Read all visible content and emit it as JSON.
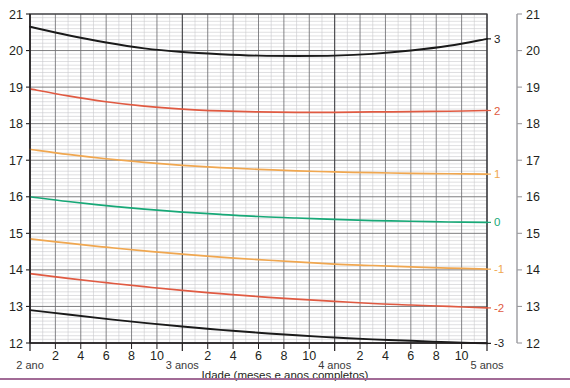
{
  "chart_data": {
    "type": "line",
    "title": "",
    "xlabel": "Idade (meses e anos completos)",
    "ylabel": "",
    "xlim": [
      24,
      60
    ],
    "ylim": [
      12,
      21
    ],
    "grid": true,
    "legend": "right-inline-zscore-labels",
    "y_ticks_left": [
      "21",
      "20",
      "19",
      "18",
      "17",
      "16",
      "15",
      "14",
      "13",
      "12"
    ],
    "y_ticks_right": [
      "21",
      "20",
      "19",
      "18",
      "17",
      "16",
      "15",
      "14",
      "13",
      "12"
    ],
    "x_tick_labels": [
      {
        "value": 24,
        "label": "2 ano",
        "major": true
      },
      {
        "value": 26,
        "label": "2",
        "major": false
      },
      {
        "value": 28,
        "label": "4",
        "major": false
      },
      {
        "value": 30,
        "label": "6",
        "major": false
      },
      {
        "value": 32,
        "label": "8",
        "major": false
      },
      {
        "value": 34,
        "label": "10",
        "major": false
      },
      {
        "value": 36,
        "label": "3 anos",
        "major": true
      },
      {
        "value": 38,
        "label": "2",
        "major": false
      },
      {
        "value": 40,
        "label": "4",
        "major": false
      },
      {
        "value": 42,
        "label": "6",
        "major": false
      },
      {
        "value": 44,
        "label": "8",
        "major": false
      },
      {
        "value": 46,
        "label": "10",
        "major": false
      },
      {
        "value": 48,
        "label": "4 anos",
        "major": true
      },
      {
        "value": 50,
        "label": "2",
        "major": false
      },
      {
        "value": 52,
        "label": "4",
        "major": false
      },
      {
        "value": 54,
        "label": "6",
        "major": false
      },
      {
        "value": 56,
        "label": "8",
        "major": false
      },
      {
        "value": 58,
        "label": "10",
        "major": false
      },
      {
        "value": 60,
        "label": "5 anos",
        "major": true
      }
    ],
    "x": [
      24,
      27,
      30,
      33,
      36,
      39,
      42,
      45,
      48,
      51,
      54,
      57,
      60
    ],
    "series": [
      {
        "name": "3",
        "zscore": "3",
        "color": "#1a1a1a",
        "end_label": "3",
        "values": [
          20.65,
          20.42,
          20.22,
          20.06,
          19.96,
          19.9,
          19.86,
          19.85,
          19.86,
          19.91,
          20.0,
          20.13,
          20.32
        ]
      },
      {
        "name": "2",
        "zscore": "2",
        "color": "#e05a42",
        "end_label": "2",
        "values": [
          18.95,
          18.76,
          18.6,
          18.48,
          18.4,
          18.35,
          18.32,
          18.31,
          18.31,
          18.32,
          18.33,
          18.34,
          18.36
        ]
      },
      {
        "name": "1",
        "zscore": "1",
        "color": "#f0a750",
        "end_label": "1",
        "values": [
          17.3,
          17.16,
          17.04,
          16.94,
          16.86,
          16.8,
          16.75,
          16.71,
          16.68,
          16.66,
          16.64,
          16.63,
          16.62
        ]
      },
      {
        "name": "0",
        "zscore": "0",
        "color": "#17a877",
        "end_label": "0",
        "values": [
          16.0,
          15.87,
          15.76,
          15.66,
          15.58,
          15.52,
          15.46,
          15.42,
          15.38,
          15.35,
          15.33,
          15.31,
          15.3
        ]
      },
      {
        "name": "-1",
        "zscore": "-1",
        "color": "#f0a750",
        "end_label": "-1",
        "values": [
          14.85,
          14.73,
          14.62,
          14.52,
          14.43,
          14.35,
          14.28,
          14.22,
          14.16,
          14.12,
          14.08,
          14.05,
          14.02
        ]
      },
      {
        "name": "-2",
        "zscore": "-2",
        "color": "#e05a42",
        "end_label": "-2",
        "values": [
          13.9,
          13.77,
          13.65,
          13.54,
          13.44,
          13.35,
          13.27,
          13.2,
          13.14,
          13.08,
          13.04,
          13.0,
          12.96
        ]
      },
      {
        "name": "-3",
        "zscore": "-3",
        "color": "#1a1a1a",
        "end_label": "-3",
        "values": [
          12.9,
          12.78,
          12.66,
          12.55,
          12.45,
          12.36,
          12.28,
          12.21,
          12.15,
          12.1,
          12.06,
          12.02,
          11.99
        ]
      }
    ],
    "colors": {
      "z3": "#1a1a1a",
      "z2": "#e05a42",
      "z1": "#f0a750",
      "z0": "#17a877",
      "grid_major": "#6f6f72",
      "grid_minor": "#c9c9cc",
      "axis": "#231f20",
      "rule": "#a26b96"
    }
  }
}
